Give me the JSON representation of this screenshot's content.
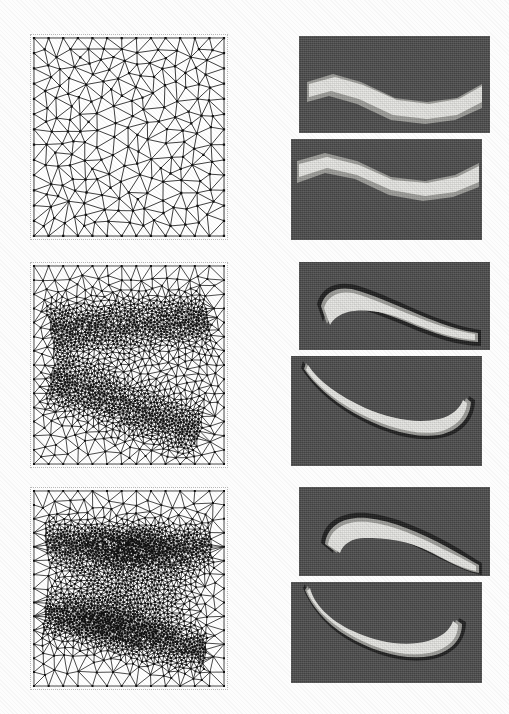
{
  "figure": {
    "type": "scientific-figure",
    "layout": "3 rows x 2 columns",
    "columns": [
      {
        "id": "meshes",
        "label": "Finite element meshes"
      },
      {
        "id": "contours",
        "label": "Shear band contour plots"
      }
    ],
    "rows": [
      {
        "id": "step-1",
        "label": "Initial uniform mesh"
      },
      {
        "id": "step-2",
        "label": "First adaptive refinement"
      },
      {
        "id": "step-3",
        "label": "Second adaptive refinement"
      }
    ],
    "background_color": "#ffffff"
  },
  "panels": {
    "mesh_1": {
      "name": "mesh-panel-initial",
      "nodes": 180,
      "refinement_level": 0,
      "density": "uniform coarse",
      "border_color": "#b9b9b9",
      "line_color": "#1c1c1c"
    },
    "mesh_2": {
      "name": "mesh-panel-refined-1",
      "nodes": 1250,
      "refinement_level": 1,
      "density": "refined along two crossing shear bands",
      "border_color": "#b9b9b9",
      "line_color": "#1c1c1c"
    },
    "mesh_3": {
      "name": "mesh-panel-refined-2",
      "nodes": 1900,
      "refinement_level": 2,
      "density": "strongly refined in central lens-shaped band region",
      "border_color": "#b9b9b9",
      "line_color": "#1c1c1c"
    },
    "contour_1": {
      "name": "contour-panel-initial",
      "band_shape": "broad straight S-shaped band",
      "background_color": "#4c4c4c",
      "band_color": "#e6e6e2",
      "mid_color": "#9c9c98",
      "dark_color": "#1e1e1e",
      "shear_offset_px": 26
    },
    "contour_2": {
      "name": "contour-panel-refined-1",
      "band_shape": "narrow curved band with dark fringe",
      "background_color": "#4c4c4c",
      "band_color": "#e6e6e2",
      "mid_color": "#9c9c98",
      "dark_color": "#1e1e1e",
      "shear_offset_px": 26
    },
    "contour_3": {
      "name": "contour-panel-refined-2",
      "band_shape": "sharp localized arc-shaped band",
      "background_color": "#4c4c4c",
      "band_color": "#e6e6e2",
      "mid_color": "#9c9c98",
      "dark_color": "#1e1e1e",
      "shear_offset_px": 26
    }
  },
  "chart_data": {
    "type": "heatmap",
    "title": "",
    "xlabel": "",
    "ylabel": "",
    "grid": false,
    "legend": "none",
    "series": [
      {
        "name": "mesh node count",
        "categories": [
          "step 1",
          "step 2",
          "step 3"
        ],
        "values": [
          180,
          1250,
          1900
        ]
      },
      {
        "name": "shear band width (relative)",
        "categories": [
          "step 1",
          "step 2",
          "step 3"
        ],
        "values": [
          1.0,
          0.45,
          0.32
        ]
      }
    ]
  }
}
